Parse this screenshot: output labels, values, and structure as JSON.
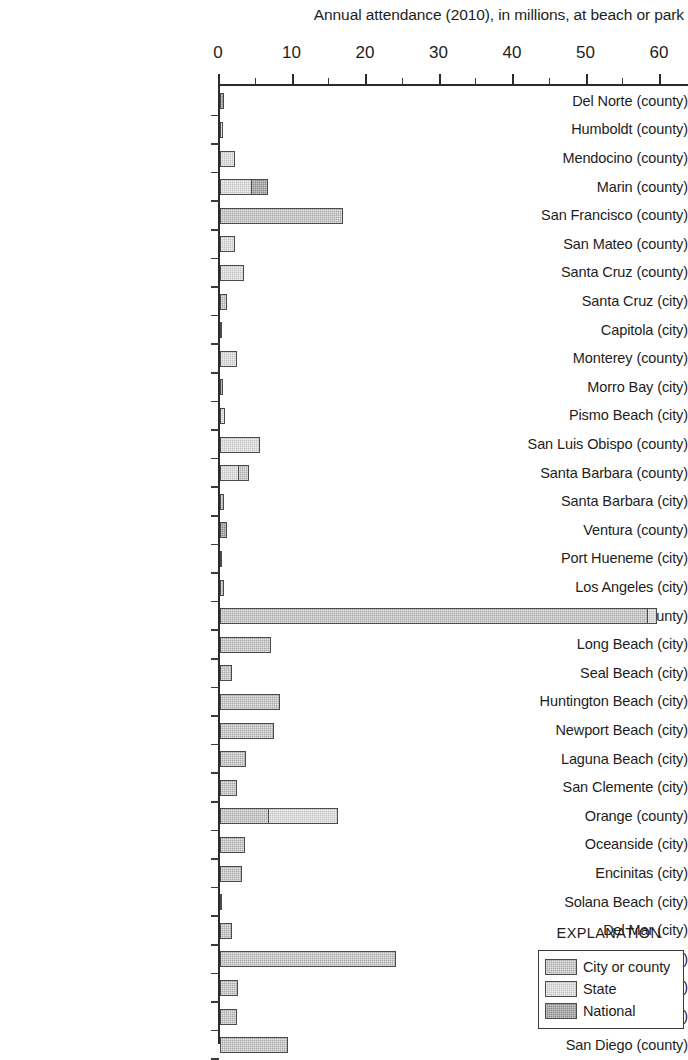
{
  "chart_data": {
    "type": "bar",
    "orientation": "horizontal",
    "title": "Annual attendance (2010), in millions, at beach or park",
    "xlabel": "",
    "ylabel": "",
    "xlim": [
      0,
      63
    ],
    "xticks": [
      0,
      10,
      20,
      30,
      40,
      50,
      60
    ],
    "xtick_labels": [
      "0",
      "10",
      "20",
      "30",
      "40",
      "50",
      "60"
    ],
    "minor_tick_interval": 5,
    "grid": false,
    "legend": {
      "title": "EXPLANATION",
      "position": "bottom-right",
      "entries": [
        {
          "label": "City or county",
          "fill": "city",
          "color": "#a9a9a9"
        },
        {
          "label": "State",
          "fill": "state",
          "color": "#c2c2c2"
        },
        {
          "label": "National",
          "fill": "national",
          "color": "#8a8a8a"
        }
      ]
    },
    "categories": [
      "Del Norte (county)",
      "Humboldt (county)",
      "Mendocino (county)",
      "Marin (county)",
      "San Francisco (county)",
      "San Mateo (county)",
      "Santa Cruz (county)",
      "Santa Cruz (city)",
      "Capitola (city)",
      "Monterey (county)",
      "Morro Bay (city)",
      "Pismo Beach (city)",
      "San Luis Obispo (county)",
      "Santa Barbara (county)",
      "Santa Barbara (city)",
      "Ventura (county)",
      "Port Hueneme (city)",
      "Los Angeles (city)",
      "Los Angeles (county)",
      "Long Beach (city)",
      "Seal Beach (city)",
      "Huntington Beach (city)",
      "Newport Beach (city)",
      "Laguna Beach (city)",
      "San Clemente (city)",
      "Orange (county)",
      "Oceanside (city)",
      "Encinitas (city)",
      "Solana Beach (city)",
      "Del Mar (city)",
      "San Diego (city)",
      "Coronado (city)",
      "Imperial Beach (city)",
      "San Diego (county)"
    ],
    "values": [
      0.5,
      0.4,
      2.0,
      6.7,
      16.8,
      2.1,
      3.2,
      1.0,
      0.25,
      2.3,
      0.4,
      0.7,
      5.4,
      4.1,
      0.6,
      0.9,
      0.3,
      0.6,
      59.6,
      6.9,
      1.7,
      8.1,
      7.3,
      3.6,
      2.3,
      16.2,
      3.4,
      3.0,
      0.3,
      1.6,
      24.0,
      2.4,
      2.3,
      9.3
    ],
    "bars": [
      {
        "category": "Del Norte (county)",
        "segments": [
          {
            "fill": "national",
            "value": 0.5
          }
        ],
        "total": 0.5
      },
      {
        "category": "Humboldt (county)",
        "segments": [
          {
            "fill": "state",
            "value": 0.4
          }
        ],
        "total": 0.4
      },
      {
        "category": "Mendocino (county)",
        "segments": [
          {
            "fill": "state",
            "value": 2.0
          }
        ],
        "total": 2.0
      },
      {
        "category": "Marin (county)",
        "segments": [
          {
            "fill": "state",
            "value": 4.4
          },
          {
            "fill": "national",
            "value": 2.3
          }
        ],
        "total": 6.7
      },
      {
        "category": "San Francisco (county)",
        "segments": [
          {
            "fill": "city",
            "value": 16.8
          }
        ],
        "total": 16.8
      },
      {
        "category": "San Mateo (county)",
        "segments": [
          {
            "fill": "state",
            "value": 2.1
          }
        ],
        "total": 2.1
      },
      {
        "category": "Santa Cruz (county)",
        "segments": [
          {
            "fill": "state",
            "value": 3.2
          }
        ],
        "total": 3.2
      },
      {
        "category": "Santa Cruz (city)",
        "segments": [
          {
            "fill": "city",
            "value": 1.0
          }
        ],
        "total": 1.0
      },
      {
        "category": "Capitola (city)",
        "segments": [
          {
            "fill": "city",
            "value": 0.25
          }
        ],
        "total": 0.25
      },
      {
        "category": "Monterey (county)",
        "segments": [
          {
            "fill": "state",
            "value": 2.3
          }
        ],
        "total": 2.3
      },
      {
        "category": "Morro Bay (city)",
        "segments": [
          {
            "fill": "national",
            "value": 0.4
          }
        ],
        "total": 0.4
      },
      {
        "category": "Pismo Beach (city)",
        "segments": [
          {
            "fill": "state",
            "value": 0.7
          }
        ],
        "total": 0.7
      },
      {
        "category": "San Luis Obispo (county)",
        "segments": [
          {
            "fill": "state",
            "value": 5.4
          }
        ],
        "total": 5.4
      },
      {
        "category": "Santa Barbara (county)",
        "segments": [
          {
            "fill": "state",
            "value": 2.6
          },
          {
            "fill": "city",
            "value": 1.5
          }
        ],
        "total": 4.1
      },
      {
        "category": "Santa Barbara (city)",
        "segments": [
          {
            "fill": "city",
            "value": 0.6
          }
        ],
        "total": 0.6
      },
      {
        "category": "Ventura (county)",
        "segments": [
          {
            "fill": "national",
            "value": 0.9
          }
        ],
        "total": 0.9
      },
      {
        "category": "Port Hueneme (city)",
        "segments": [
          {
            "fill": "city",
            "value": 0.3
          }
        ],
        "total": 0.3
      },
      {
        "category": "Los Angeles (city)",
        "segments": [
          {
            "fill": "city",
            "value": 0.6
          }
        ],
        "total": 0.6
      },
      {
        "category": "Los Angeles (county)",
        "segments": [
          {
            "fill": "city",
            "value": 58.2
          },
          {
            "fill": "state",
            "value": 1.4
          }
        ],
        "total": 59.6
      },
      {
        "category": "Long Beach (city)",
        "segments": [
          {
            "fill": "city",
            "value": 6.9
          }
        ],
        "total": 6.9
      },
      {
        "category": "Seal Beach (city)",
        "segments": [
          {
            "fill": "city",
            "value": 1.7
          }
        ],
        "total": 1.7
      },
      {
        "category": "Huntington Beach (city)",
        "segments": [
          {
            "fill": "city",
            "value": 8.1
          }
        ],
        "total": 8.1
      },
      {
        "category": "Newport Beach (city)",
        "segments": [
          {
            "fill": "city",
            "value": 7.3
          }
        ],
        "total": 7.3
      },
      {
        "category": "Laguna Beach (city)",
        "segments": [
          {
            "fill": "city",
            "value": 3.6
          }
        ],
        "total": 3.6
      },
      {
        "category": "San Clemente (city)",
        "segments": [
          {
            "fill": "city",
            "value": 2.3
          }
        ],
        "total": 2.3
      },
      {
        "category": "Orange (county)",
        "segments": [
          {
            "fill": "city",
            "value": 6.7
          },
          {
            "fill": "state",
            "value": 9.5
          }
        ],
        "total": 16.2
      },
      {
        "category": "Oceanside (city)",
        "segments": [
          {
            "fill": "city",
            "value": 3.4
          }
        ],
        "total": 3.4
      },
      {
        "category": "Encinitas (city)",
        "segments": [
          {
            "fill": "city",
            "value": 3.0
          }
        ],
        "total": 3.0
      },
      {
        "category": "Solana Beach (city)",
        "segments": [
          {
            "fill": "city",
            "value": 0.3
          }
        ],
        "total": 0.3
      },
      {
        "category": "Del Mar (city)",
        "segments": [
          {
            "fill": "city",
            "value": 1.6
          }
        ],
        "total": 1.6
      },
      {
        "category": "San Diego (city)",
        "segments": [
          {
            "fill": "city",
            "value": 24.0
          }
        ],
        "total": 24.0
      },
      {
        "category": "Coronado (city)",
        "segments": [
          {
            "fill": "city",
            "value": 2.4
          }
        ],
        "total": 2.4
      },
      {
        "category": "Imperial Beach (city)",
        "segments": [
          {
            "fill": "city",
            "value": 2.3
          }
        ],
        "total": 2.3
      },
      {
        "category": "San Diego (county)",
        "segments": [
          {
            "fill": "city",
            "value": 9.3
          }
        ],
        "total": 9.3
      }
    ]
  }
}
